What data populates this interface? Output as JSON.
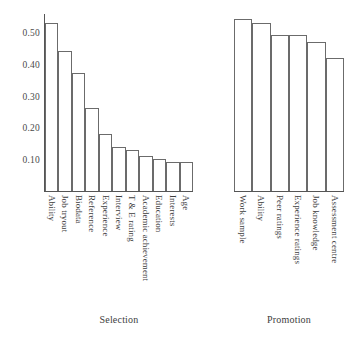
{
  "chart_data": {
    "type": "bar",
    "title": "",
    "xlabel": "",
    "ylabel": "",
    "ylim": [
      0,
      0.56
    ],
    "grid": false,
    "legend": "none",
    "ytick_labels": [
      "0.50",
      "0.40",
      "0.30",
      "0.20",
      "0.10"
    ],
    "ytick_values": [
      0.5,
      0.4,
      0.3,
      0.2,
      0.1
    ],
    "panels": [
      {
        "caption": "Selection",
        "categories": [
          "Ability",
          "Job tryout",
          "Biodata",
          "Reference",
          "Experience",
          "Interview",
          "T & E rating",
          "Academic achievement",
          "Education",
          "Interests",
          "Age"
        ],
        "values": [
          0.53,
          0.44,
          0.37,
          0.26,
          0.18,
          0.14,
          0.13,
          0.11,
          0.1,
          0.09,
          0.09
        ]
      },
      {
        "caption": "Promotion",
        "categories": [
          "Work sample",
          "Ability",
          "Peer ratings",
          "Experience ratings",
          "Job knowledge",
          "Assessment centre"
        ],
        "values": [
          0.54,
          0.53,
          0.49,
          0.49,
          0.47,
          0.42
        ]
      }
    ]
  },
  "colors": {
    "bar_fill": "#ffffff",
    "bar_stroke": "#6b6b6b",
    "axis": "#555555",
    "text": "#3d3d3d",
    "background": "#ffffff"
  }
}
